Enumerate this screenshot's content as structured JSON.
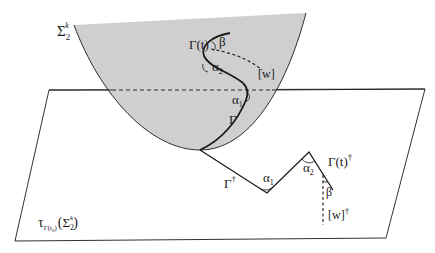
{
  "figure": {
    "colors": {
      "surface_fill": "#cfcfcf",
      "line": "#1a1a1a",
      "background": "#ffffff"
    },
    "surface": {
      "label_main": "Σ",
      "label_sub": "2",
      "label_sup": "k"
    },
    "curve_on_surface": {
      "gamma_t": "Γ(t)",
      "beta": "β",
      "alpha2": "α",
      "alpha2_sub": "2",
      "w": "[w]",
      "alpha1": "α",
      "alpha1_sub": "1",
      "gamma": "Γ"
    },
    "tangent_plane": {
      "tau": "τ",
      "tau_sub": "Γ(t",
      "tau_sub_sub": "0",
      "tau_sub_close": ")",
      "paren_open": "(",
      "sigma": "Σ",
      "sigma_sub": "2",
      "sigma_sup": "k",
      "paren_close": ")"
    },
    "developed_curve": {
      "gamma_dagger": "Γ",
      "dagger": "†",
      "alpha1": "α",
      "alpha1_sub": "1",
      "alpha2": "α",
      "alpha2_sub": "2",
      "gamma_t_dagger": "Γ(t)",
      "gamma_t_dagger_mark": "†",
      "beta": "β",
      "w_dagger": "[w]",
      "w_dagger_mark": "†"
    }
  }
}
